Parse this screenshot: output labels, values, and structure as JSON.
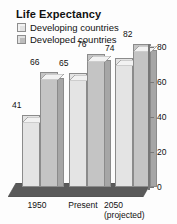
{
  "chart_data": {
    "type": "bar",
    "title": "Life Expectancy",
    "xlabel": "",
    "ylabel": "",
    "ylim": [
      0,
      80
    ],
    "yticks": [
      0,
      20,
      40,
      60,
      80
    ],
    "grid": false,
    "legend_position": "top-left",
    "categories": [
      "1950",
      "Present",
      "2050 (projected)"
    ],
    "category_labels": [
      {
        "line1": "1950",
        "line2": ""
      },
      {
        "line1": "Present",
        "line2": ""
      },
      {
        "line1": "2050",
        "line2": "(projected)"
      }
    ],
    "series": [
      {
        "name": "Developing countries",
        "color": "#e4e4e4",
        "values": [
          41,
          65,
          74
        ]
      },
      {
        "name": "Developed countries",
        "color": "#c4c4c4",
        "values": [
          66,
          76,
          82
        ]
      }
    ],
    "bars": [
      {
        "group": "1950",
        "series": "Developing countries",
        "value": 41,
        "label": "41"
      },
      {
        "group": "1950",
        "series": "Developed countries",
        "value": 66,
        "label": "66"
      },
      {
        "group": "Present",
        "series": "Developing countries",
        "value": 65,
        "label": "65"
      },
      {
        "group": "Present",
        "series": "Developed countries",
        "value": 76,
        "label": "76"
      },
      {
        "group": "2050 (projected)",
        "series": "Developing countries",
        "value": 74,
        "label": "74"
      },
      {
        "group": "2050 (projected)",
        "series": "Developed countries",
        "value": 82,
        "label": "82"
      }
    ]
  },
  "title": "Life Expectancy",
  "legend": {
    "developing": "Developing countries",
    "developed": "Developed countries"
  },
  "axis": {
    "y": {
      "t0": "0",
      "t20": "20",
      "t40": "40",
      "t60": "60",
      "t80": "80"
    },
    "x": {
      "g1": "1950",
      "g2": "Present",
      "g3a": "2050",
      "g3b": "(projected)"
    }
  },
  "values": {
    "g1_developing": "41",
    "g1_developed": "66",
    "g2_developing": "65",
    "g2_developed": "76",
    "g3_developing": "74",
    "g3_developed": "82"
  },
  "colors": {
    "developing": "#e4e4e4",
    "developed": "#c4c4c4",
    "floor": "#5a5a5a",
    "axis": "#777777",
    "text": "#111111"
  }
}
